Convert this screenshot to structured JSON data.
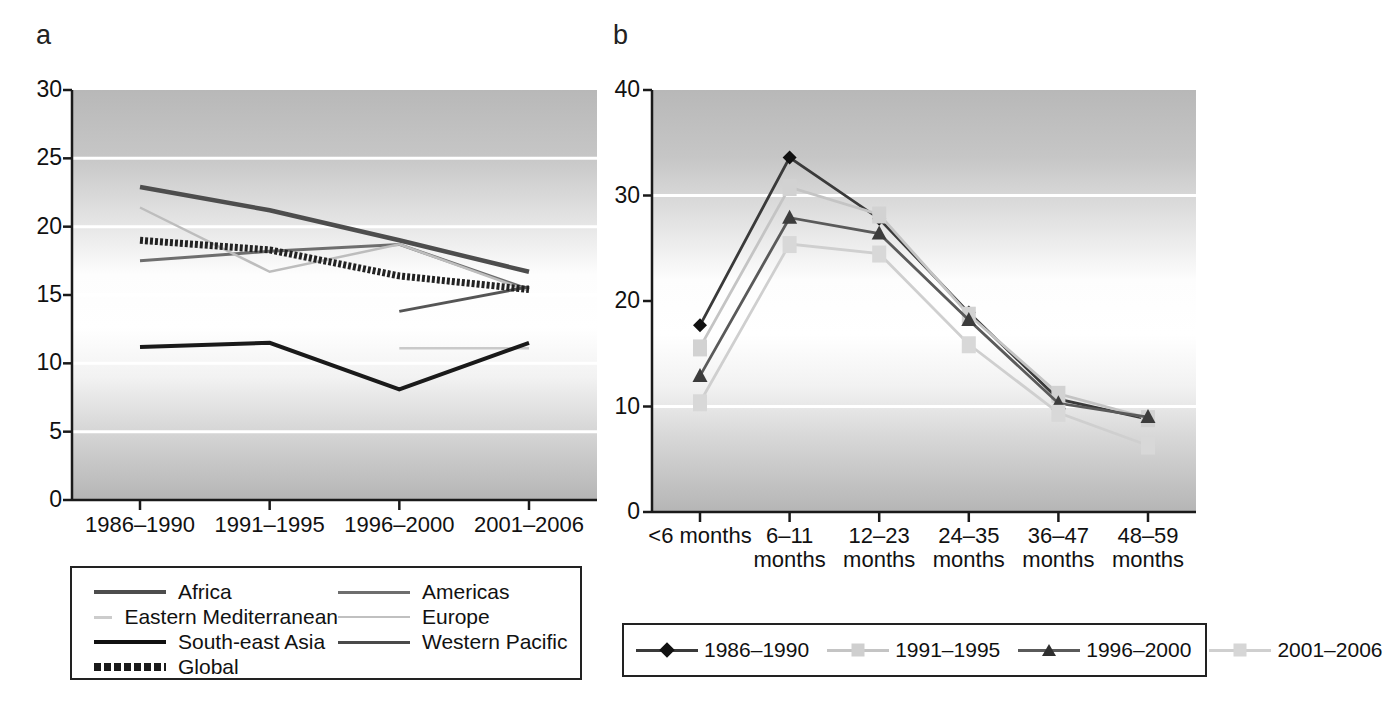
{
  "panels": {
    "a": {
      "letter": "a"
    },
    "b": {
      "letter": "b"
    }
  },
  "chart_data": [
    {
      "panel": "a",
      "type": "line",
      "title": "",
      "xlabel": "",
      "ylabel": "",
      "ylim": [
        0,
        30
      ],
      "yticks": [
        0,
        5,
        10,
        15,
        20,
        25,
        30
      ],
      "grid": true,
      "legend_position": "below",
      "categories": [
        "1986–1990",
        "1991–1995",
        "1996–2000",
        "2001–2006"
      ],
      "series": [
        {
          "name": "Africa",
          "color": "#4d4d4d",
          "width": 4.5,
          "dash": "none",
          "values": [
            22.9,
            21.2,
            19.0,
            16.7
          ]
        },
        {
          "name": "Americas",
          "color": "#6e6e6e",
          "width": 3.0,
          "dash": "none",
          "values": [
            17.5,
            18.2,
            18.7,
            15.4
          ]
        },
        {
          "name": "Eastern Mediterranean",
          "color": "#c9c9c9",
          "width": 2.5,
          "dash": "none",
          "values": [
            null,
            null,
            11.1,
            11.1
          ]
        },
        {
          "name": "Europe",
          "color": "#bdbdbd",
          "width": 2.5,
          "dash": "none",
          "values": [
            21.4,
            16.7,
            18.7,
            15.3
          ]
        },
        {
          "name": "South-east Asia",
          "color": "#1a1a1a",
          "width": 4.0,
          "dash": "none",
          "values": [
            11.2,
            11.5,
            8.1,
            11.5
          ]
        },
        {
          "name": "Western Pacific",
          "color": "#555555",
          "width": 3.0,
          "dash": "none",
          "values": [
            null,
            null,
            13.8,
            15.6
          ]
        },
        {
          "name": "Global",
          "color": "#222222",
          "width": 7.0,
          "dash": "3 2",
          "values": [
            19.0,
            18.3,
            16.4,
            15.4
          ]
        }
      ]
    },
    {
      "panel": "b",
      "type": "line",
      "title": "",
      "xlabel": "",
      "ylabel": "",
      "ylim": [
        0,
        40
      ],
      "yticks": [
        0,
        10,
        20,
        30,
        40
      ],
      "grid": true,
      "legend_position": "below",
      "categories": [
        "<6 months",
        "6–11 months",
        "12–23 months",
        "24–35 months",
        "36–47 months",
        "48–59 months"
      ],
      "series": [
        {
          "name": "1986–1990",
          "color": "#3a3a3a",
          "marker": "diamond",
          "markerColor": "#111111",
          "width": 2.8,
          "values": [
            17.7,
            33.6,
            27.8,
            18.9,
            10.7,
            8.8
          ]
        },
        {
          "name": "1991–1995",
          "color": "#c4c4c4",
          "marker": "square",
          "markerColor": "#d2d2d2",
          "width": 2.8,
          "values": [
            15.6,
            30.8,
            28.2,
            18.7,
            11.2,
            8.9
          ]
        },
        {
          "name": "1996–2000",
          "color": "#5a5a5a",
          "marker": "triangle",
          "markerColor": "#3c3c3c",
          "width": 2.8,
          "values": [
            12.9,
            27.9,
            26.4,
            18.2,
            10.3,
            9.0
          ]
        },
        {
          "name": "2001–2006",
          "color": "#cfcfcf",
          "marker": "square",
          "markerColor": "#d8d8d8",
          "width": 2.8,
          "values": [
            10.4,
            25.4,
            24.5,
            15.9,
            9.4,
            6.3
          ]
        }
      ]
    }
  ],
  "legend_a": {
    "items": [
      {
        "label": "Africa",
        "color": "#4d4d4d",
        "width": 4,
        "dash": "none"
      },
      {
        "label": "Americas",
        "color": "#6e6e6e",
        "width": 3,
        "dash": "none"
      },
      {
        "label": "Eastern Mediterranean",
        "color": "#cccccc",
        "width": 3,
        "dash": "none"
      },
      {
        "label": "Europe",
        "color": "#c0c0c0",
        "width": 2,
        "dash": "none"
      },
      {
        "label": "South-east Asia",
        "color": "#111111",
        "width": 4,
        "dash": "none"
      },
      {
        "label": "Western Pacific",
        "color": "#4a4a4a",
        "width": 3,
        "dash": "none"
      },
      {
        "label": "Global",
        "color": "#1a1a1a",
        "width": 8,
        "dash": "dotted"
      }
    ]
  },
  "legend_b": {
    "items": [
      {
        "label": "1986–1990",
        "color": "#3a3a3a",
        "marker": "diamond",
        "markerColor": "#111111"
      },
      {
        "label": "1991–1995",
        "color": "#c4c4c4",
        "marker": "square",
        "markerColor": "#cfcfcf"
      },
      {
        "label": "1996–2000",
        "color": "#5a5a5a",
        "marker": "triangle",
        "markerColor": "#2f2f2f"
      },
      {
        "label": "2001–2006",
        "color": "#cfcfcf",
        "marker": "square",
        "markerColor": "#d6d6d6"
      }
    ]
  }
}
